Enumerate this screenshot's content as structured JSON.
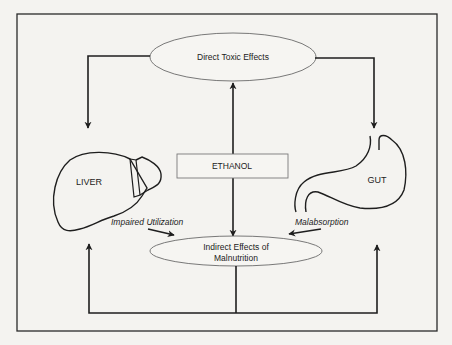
{
  "diagram": {
    "nodes": {
      "direct_toxic": {
        "label": "Direct Toxic Effects",
        "shape": "ellipse"
      },
      "ethanol": {
        "label": "ETHANOL",
        "shape": "rectangle"
      },
      "indirect": {
        "label_line1": "Indirect Effects of",
        "label_line2": "Malnutrition",
        "shape": "ellipse"
      },
      "liver": {
        "label": "LIVER",
        "shape": "liver-outline"
      },
      "gut": {
        "label": "GUT",
        "shape": "stomach-outline"
      }
    },
    "edges": [
      {
        "from": "ethanol",
        "to": "direct_toxic",
        "label": ""
      },
      {
        "from": "ethanol",
        "to": "indirect",
        "label": ""
      },
      {
        "from": "direct_toxic",
        "to": "liver",
        "label": ""
      },
      {
        "from": "direct_toxic",
        "to": "gut",
        "label": ""
      },
      {
        "from": "liver",
        "to": "indirect",
        "label": "Impaired Utilization"
      },
      {
        "from": "gut",
        "to": "indirect",
        "label": "Malabsorption"
      },
      {
        "from": "indirect",
        "to": "liver",
        "label": ""
      },
      {
        "from": "indirect",
        "to": "gut",
        "label": ""
      }
    ],
    "edge_labels": {
      "impaired_utilization": "Impaired Utilization",
      "malabsorption": "Malabsorption"
    },
    "colors": {
      "background": "#f4f3f0",
      "line": "#1e1e1e",
      "ellipse_stroke": "#6a6a6a",
      "box_stroke": "#7a7a7a"
    }
  }
}
